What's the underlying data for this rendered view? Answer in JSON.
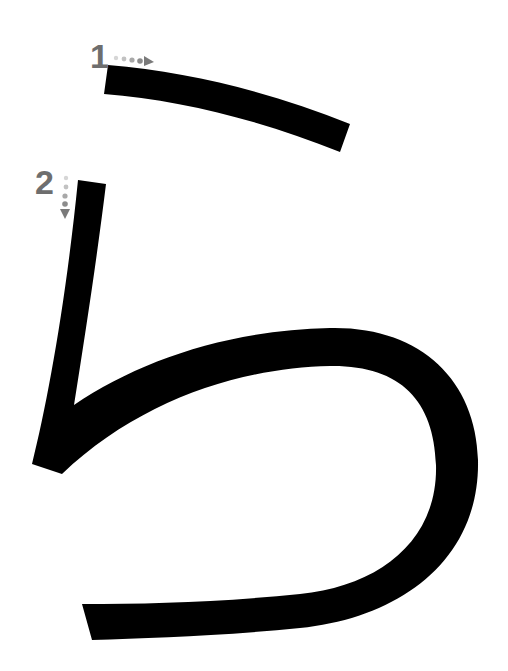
{
  "diagram": {
    "character": "ら",
    "type": "hiragana stroke order",
    "stroke_color": "#000000",
    "label_color": "#6e6e6e",
    "arrow_color": "#7a7a7a",
    "strokes": [
      {
        "order": "1",
        "label": "1",
        "direction": "left-to-right",
        "arrow": "right-arrow"
      },
      {
        "order": "2",
        "label": "2",
        "direction": "top-to-bottom",
        "arrow": "down-arrow"
      }
    ]
  }
}
